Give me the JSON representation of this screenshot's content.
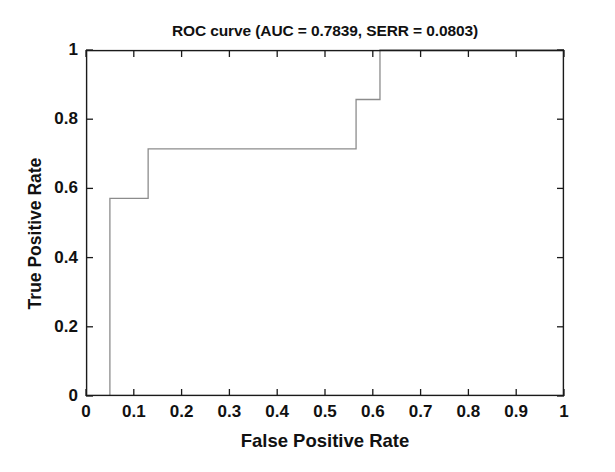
{
  "chart_data": {
    "type": "line",
    "title": "ROC curve (AUC = 0.7839, SERR = 0.0803)",
    "xlabel": "False Positive Rate",
    "ylabel": "True Positive Rate",
    "xlim": [
      0,
      1
    ],
    "ylim": [
      0,
      1
    ],
    "grid": false,
    "legend": "none",
    "xticks": [
      "0",
      "0.1",
      "0.2",
      "0.3",
      "0.4",
      "0.5",
      "0.6",
      "0.7",
      "0.8",
      "0.9",
      "1"
    ],
    "xtick_values": [
      0,
      0.1,
      0.2,
      0.3,
      0.4,
      0.5,
      0.6,
      0.7,
      0.8,
      0.9,
      1
    ],
    "yticks": [
      "0",
      "0.2",
      "0.4",
      "0.6",
      "0.8",
      "1"
    ],
    "ytick_values": [
      0,
      0.2,
      0.4,
      0.6,
      0.8,
      1
    ],
    "series": [
      {
        "name": "ROC curve",
        "drawstyle": "steps-post",
        "color": "#8c8c8c",
        "x": [
          0.05,
          0.05,
          0.13,
          0.13,
          0.565,
          0.565,
          0.615,
          0.615,
          1.0
        ],
        "y": [
          0.0,
          0.571,
          0.571,
          0.714,
          0.714,
          0.857,
          0.857,
          1.0,
          1.0
        ]
      }
    ],
    "annotations": {
      "auc": "0.7839",
      "serr": "0.0803"
    },
    "axis_color": "#1a1a1a"
  }
}
